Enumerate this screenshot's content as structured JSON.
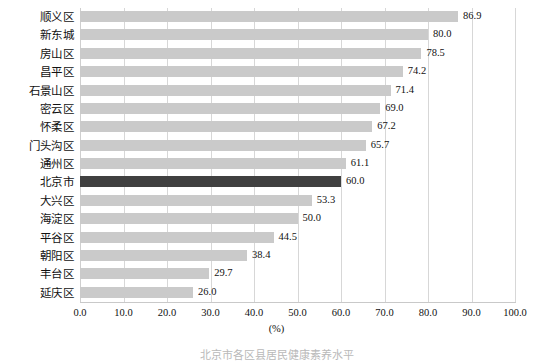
{
  "chart_data": {
    "type": "bar",
    "orientation": "horizontal",
    "title": "",
    "xlabel": "(%)",
    "ylabel": "",
    "xlim": [
      0.0,
      100.0
    ],
    "xtick_step": 10.0,
    "xticks": [
      "0.0",
      "10.0",
      "20.0",
      "30.0",
      "40.0",
      "50.0",
      "60.0",
      "70.0",
      "80.0",
      "90.0",
      "100.0"
    ],
    "grid": "vertical",
    "legend": "none",
    "categories": [
      "顺义区",
      "新东城",
      "房山区",
      "昌平区",
      "石景山区",
      "密云区",
      "怀柔区",
      "门头沟区",
      "通州区",
      "北京市",
      "大兴区",
      "海淀区",
      "平谷区",
      "朝阳区",
      "丰台区",
      "延庆区"
    ],
    "values": [
      86.9,
      80.0,
      78.5,
      74.2,
      71.4,
      69.0,
      67.2,
      65.7,
      61.1,
      60.0,
      53.3,
      50.0,
      44.5,
      38.4,
      29.7,
      26.0
    ],
    "value_labels": [
      "86.9",
      "80.0",
      "78.5",
      "74.2",
      "71.4",
      "69.0",
      "67.2",
      "65.7",
      "61.1",
      "60.0",
      "53.3",
      "50.0",
      "44.5",
      "38.4",
      "29.7",
      "26.0"
    ],
    "highlight_category": "北京市",
    "colors": {
      "bar": "#cacaca",
      "bar_highlight": "#404040",
      "gridline": "#d7d7d7",
      "axis": "#c9c9c9",
      "text": "#111111"
    }
  },
  "axis": {
    "unit_label": "(%)"
  },
  "caption": {
    "text": "北京市各区县居民健康素养水平"
  }
}
